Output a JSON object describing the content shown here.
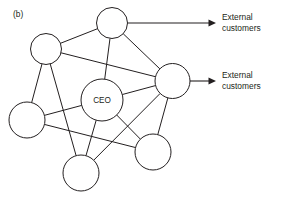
{
  "figure": {
    "panel_label": "(b)",
    "caption_note": "",
    "background_color": "#ffffff",
    "line_color": "#231f20"
  },
  "diagram": {
    "type": "network-diagram",
    "title": "",
    "nodes": [
      {
        "id": "top",
        "name": "node-top",
        "label": "",
        "cx": 112,
        "cy": 23,
        "r": 15.5
      },
      {
        "id": "upper-left",
        "name": "node-upper-left",
        "label": "",
        "cx": 46,
        "cy": 49,
        "r": 15.5
      },
      {
        "id": "right",
        "name": "node-right",
        "label": "",
        "cx": 172.5,
        "cy": 81,
        "r": 17.5
      },
      {
        "id": "ceo",
        "name": "node-ceo",
        "label": "CEO",
        "cx": 102,
        "cy": 100,
        "r": 21
      },
      {
        "id": "left-lower",
        "name": "node-left-lower",
        "label": "",
        "cx": 27,
        "cy": 120,
        "r": 18
      },
      {
        "id": "bottom-right",
        "name": "node-bottom-right",
        "label": "",
        "cx": 153,
        "cy": 152,
        "r": 18
      },
      {
        "id": "bottom",
        "name": "node-bottom",
        "label": "",
        "cx": 81,
        "cy": 173,
        "r": 18
      }
    ],
    "edges": [
      {
        "from": "upper-left",
        "to": "top"
      },
      {
        "from": "upper-left",
        "to": "right"
      },
      {
        "from": "upper-left",
        "to": "left-lower"
      },
      {
        "from": "upper-left",
        "to": "bottom"
      },
      {
        "from": "top",
        "to": "ceo"
      },
      {
        "from": "top",
        "to": "right"
      },
      {
        "from": "right",
        "to": "ceo"
      },
      {
        "from": "right",
        "to": "bottom-right"
      },
      {
        "from": "right",
        "to": "bottom"
      },
      {
        "from": "ceo",
        "to": "left-lower"
      },
      {
        "from": "ceo",
        "to": "bottom"
      },
      {
        "from": "ceo",
        "to": "bottom-right"
      },
      {
        "from": "left-lower",
        "to": "bottom-right"
      }
    ],
    "arrows": [
      {
        "id": "arrow-top",
        "name": "arrow-external-customers-top",
        "from_node": "top",
        "x1": 128,
        "y1": 23,
        "x2": 216,
        "y2": 23,
        "label_lines": [
          "External",
          "customers"
        ],
        "label_x": 222,
        "label_y": 13
      },
      {
        "id": "arrow-right",
        "name": "arrow-external-customers-right",
        "from_node": "right",
        "x1": 190,
        "y1": 81,
        "x2": 216,
        "y2": 81,
        "label_lines": [
          "External",
          "customers"
        ],
        "label_x": 222,
        "label_y": 71
      }
    ]
  },
  "labels": {
    "panel": "(b)",
    "outflow_1_line_1": "External",
    "outflow_1_line_2": "customers",
    "outflow_2_line_1": "External",
    "outflow_2_line_2": "customers",
    "ceo": "CEO"
  }
}
